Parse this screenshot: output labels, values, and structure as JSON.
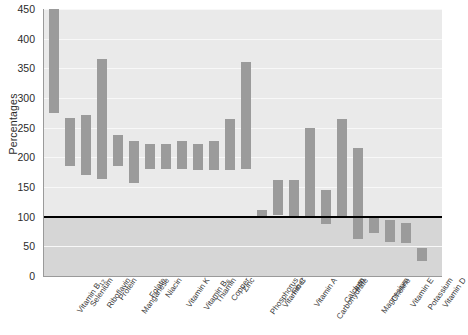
{
  "chart_data": {
    "type": "bar",
    "title": "",
    "subtitle": "",
    "xlabel": "",
    "ylabel": "Percentages",
    "ylim": [
      0,
      450
    ],
    "ytick_values": [
      0,
      50,
      100,
      150,
      200,
      250,
      300,
      350,
      400,
      450
    ],
    "ytick_labels": [
      "0",
      "50",
      "100",
      "150",
      "200",
      "250",
      "300",
      "350",
      "400",
      "450"
    ],
    "grid": true,
    "legend": "none",
    "bar_orientation": "vertical",
    "bar_style": "floating-range",
    "bar_color": "#9b9b9b",
    "plot_background": "#eaeaea",
    "below_threshold_band_color": "#d6d6d6",
    "reference_line": {
      "value": 100,
      "color": "#000000",
      "label": "100% reference"
    },
    "categories": [
      "Vitamin B12",
      "Selenium",
      "Riboflavin",
      "Protein",
      "Manganese",
      "Folate",
      "Niacin",
      "Vitamin K",
      "Vitamin B6",
      "Thiamin",
      "Copper",
      "Zinc",
      "Phosphorus",
      "Vitamin C",
      "Fiber",
      "Vitamin A",
      "Carbohydrate",
      "Calcium",
      "Iron",
      "Magnesium",
      "Choline",
      "Vitamin E",
      "Potassium",
      "Vitamin D"
    ],
    "categories_html": [
      "Vitamin B<sub>12</sub>",
      "Selenium",
      "Riboflavin",
      "Protein",
      "Manganese",
      "Folate",
      "Niacin",
      "Vitamin K",
      "Vitamin B<sub>6</sub>",
      "Thiamin",
      "Copper",
      "Zinc",
      "Phosphorus",
      "Vitamin C",
      "Fiber",
      "Vitamin A",
      "Carbohydrate",
      "Calcium",
      "Iron",
      "Magnesium",
      "Choline",
      "Vitamin E",
      "Potassium",
      "Vitamin D"
    ],
    "series": [
      {
        "name": "range_low",
        "values": [
          274,
          185,
          170,
          163,
          185,
          157,
          180,
          180,
          180,
          178,
          178,
          178,
          180,
          100,
          102,
          100,
          100,
          88,
          100,
          62,
          72,
          58,
          55,
          25
        ]
      },
      {
        "name": "range_high",
        "values": [
          450,
          267,
          272,
          365,
          237,
          228,
          222,
          222,
          228,
          222,
          228,
          265,
          360,
          112,
          162,
          162,
          250,
          145,
          265,
          215,
          100,
          95,
          90,
          48
        ]
      }
    ],
    "bars": [
      {
        "category": "Vitamin B12",
        "low": 274,
        "high": 450
      },
      {
        "category": "Selenium",
        "low": 185,
        "high": 267
      },
      {
        "category": "Riboflavin",
        "low": 170,
        "high": 272
      },
      {
        "category": "Protein",
        "low": 163,
        "high": 365
      },
      {
        "category": "Manganese",
        "low": 185,
        "high": 237
      },
      {
        "category": "Folate",
        "low": 157,
        "high": 228
      },
      {
        "category": "Niacin",
        "low": 180,
        "high": 222
      },
      {
        "category": "Vitamin K",
        "low": 180,
        "high": 222
      },
      {
        "category": "Vitamin B6",
        "low": 180,
        "high": 228
      },
      {
        "category": "Thiamin",
        "low": 178,
        "high": 222
      },
      {
        "category": "Copper",
        "low": 178,
        "high": 228
      },
      {
        "category": "Zinc",
        "low": 178,
        "high": 265
      },
      {
        "category": "Phosphorus",
        "low": 180,
        "high": 360
      },
      {
        "category": "Vitamin C",
        "low": 100,
        "high": 112
      },
      {
        "category": "Fiber",
        "low": 102,
        "high": 162
      },
      {
        "category": "Vitamin A",
        "low": 100,
        "high": 162
      },
      {
        "category": "Carbohydrate",
        "low": 100,
        "high": 250
      },
      {
        "category": "Calcium",
        "low": 88,
        "high": 145
      },
      {
        "category": "Iron",
        "low": 100,
        "high": 265
      },
      {
        "category": "Magnesium",
        "low": 62,
        "high": 215
      },
      {
        "category": "Choline",
        "low": 72,
        "high": 100
      },
      {
        "category": "Vitamin E",
        "low": 58,
        "high": 95
      },
      {
        "category": "Potassium",
        "low": 55,
        "high": 90
      },
      {
        "category": "Vitamin D",
        "low": 25,
        "high": 48
      }
    ]
  }
}
